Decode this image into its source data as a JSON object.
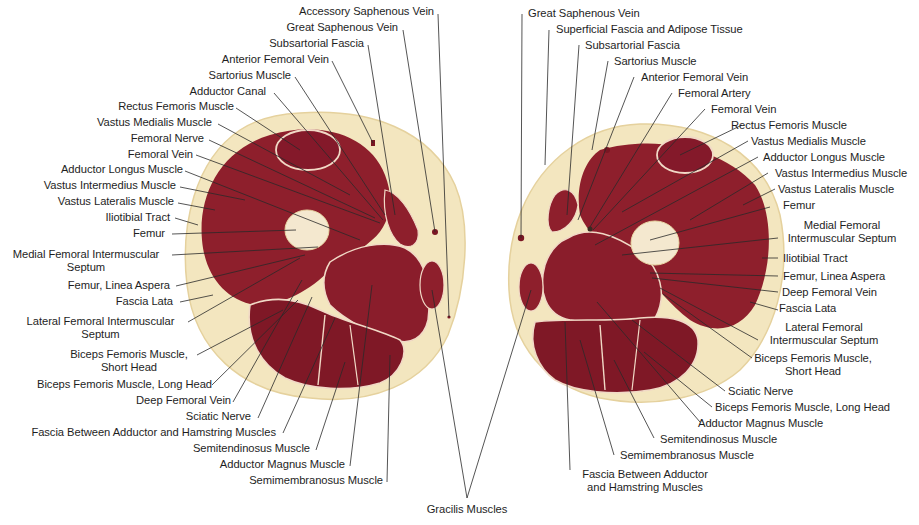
{
  "figure": {
    "type": "anatomical cross-section",
    "panels": [
      "left thigh cross-section",
      "right thigh cross-section"
    ],
    "colors": {
      "background": "#ffffff",
      "fat": "#f3e6bf",
      "fat_edge": "#e8d6a4",
      "muscle": "#8e1f2c",
      "muscle_dark": "#7a1623",
      "fascia": "#f1d9c6",
      "bone": "#f4e8cf",
      "leader_line": "#2a2a2a",
      "text": "#1e1e1e"
    }
  },
  "left_labels": [
    {
      "id": "L1",
      "text": "Accessory Saphenous Vein"
    },
    {
      "id": "L2",
      "text": "Great Saphenous Vein"
    },
    {
      "id": "L3",
      "text": "Subsartorial Fascia"
    },
    {
      "id": "L4",
      "text": "Anterior Femoral Vein"
    },
    {
      "id": "L5",
      "text": "Sartorius Muscle"
    },
    {
      "id": "L6",
      "text": "Adductor Canal"
    },
    {
      "id": "L7",
      "text": "Rectus Femoris Muscle"
    },
    {
      "id": "L8",
      "text": "Vastus Medialis Muscle"
    },
    {
      "id": "L9",
      "text": "Femoral Nerve"
    },
    {
      "id": "L10",
      "text": "Femoral Vein"
    },
    {
      "id": "L11",
      "text": "Adductor Longus Muscle"
    },
    {
      "id": "L12",
      "text": "Vastus Intermedius Muscle"
    },
    {
      "id": "L13",
      "text": "Vastus Lateralis Muscle"
    },
    {
      "id": "L14",
      "text": "Iliotibial Tract"
    },
    {
      "id": "L15",
      "text": "Femur"
    },
    {
      "id": "L16",
      "text": "Medial Femoral Intermuscular",
      "text2": "Septum"
    },
    {
      "id": "L17",
      "text": "Femur, Linea Aspera"
    },
    {
      "id": "L18",
      "text": "Fascia Lata"
    },
    {
      "id": "L19",
      "text": "Lateral Femoral Intermuscular",
      "text2": "Septum"
    },
    {
      "id": "L20",
      "text": "Biceps Femoris Muscle,",
      "text2": "Short Head"
    },
    {
      "id": "L21",
      "text": "Biceps Femoris Muscle, Long Head"
    },
    {
      "id": "L22",
      "text": "Deep Femoral Vein"
    },
    {
      "id": "L23",
      "text": "Sciatic Nerve"
    },
    {
      "id": "L24",
      "text": "Fascia Between Adductor and Hamstring Muscles"
    },
    {
      "id": "L25",
      "text": "Semitendinosus Muscle"
    },
    {
      "id": "L26",
      "text": "Adductor Magnus Muscle"
    },
    {
      "id": "L27",
      "text": "Semimembranosus Muscle"
    }
  ],
  "right_labels": [
    {
      "id": "R1",
      "text": "Great Saphenous Vein"
    },
    {
      "id": "R2",
      "text": "Superficial Fascia and Adipose Tissue"
    },
    {
      "id": "R3",
      "text": "Subsartorial Fascia"
    },
    {
      "id": "R4",
      "text": "Sartorius Muscle"
    },
    {
      "id": "R5",
      "text": "Anterior Femoral Vein"
    },
    {
      "id": "R6",
      "text": "Femoral Artery"
    },
    {
      "id": "R7",
      "text": "Femoral Vein"
    },
    {
      "id": "R8",
      "text": "Rectus Femoris Muscle"
    },
    {
      "id": "R9",
      "text": "Vastus Medialis Muscle"
    },
    {
      "id": "R10",
      "text": "Adductor Longus Muscle"
    },
    {
      "id": "R11",
      "text": "Vastus Intermedius Muscle"
    },
    {
      "id": "R12",
      "text": "Vastus Lateralis Muscle"
    },
    {
      "id": "R13",
      "text": "Femur"
    },
    {
      "id": "R14",
      "text": "Medial Femoral",
      "text2": "Intermuscular Septum"
    },
    {
      "id": "R15",
      "text": "Iliotibial Tract"
    },
    {
      "id": "R16",
      "text": "Femur, Linea Aspera"
    },
    {
      "id": "R17",
      "text": "Deep Femoral Vein"
    },
    {
      "id": "R18",
      "text": "Fascia Lata"
    },
    {
      "id": "R19",
      "text": "Lateral Femoral",
      "text2": "Intermuscular Septum"
    },
    {
      "id": "R20",
      "text": "Biceps Femoris Muscle,",
      "text2": "Short Head"
    },
    {
      "id": "R21",
      "text": "Sciatic Nerve"
    },
    {
      "id": "R22",
      "text": "Biceps Femoris Muscle, Long Head"
    },
    {
      "id": "R23",
      "text": "Adductor Magnus Muscle"
    },
    {
      "id": "R24",
      "text": "Semitendinosus Muscle"
    },
    {
      "id": "R25",
      "text": "Semimembranosus Muscle"
    },
    {
      "id": "R26",
      "text": "Fascia Between Adductor",
      "text2": "and Hamstring Muscles"
    }
  ],
  "shared_labels": [
    {
      "id": "S1",
      "text": "Gracilis Muscles"
    }
  ]
}
